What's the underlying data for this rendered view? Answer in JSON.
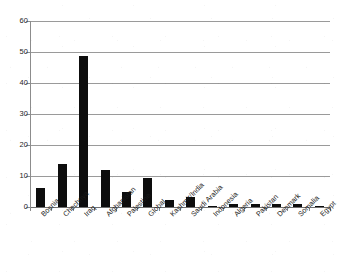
{
  "chart_data": {
    "type": "bar",
    "title": "",
    "subtitle": "",
    "xlabel": "",
    "ylabel": "",
    "ylim": [
      0,
      60
    ],
    "ytick_labels": [
      "0",
      "10",
      "20",
      "30",
      "40",
      "50",
      "60"
    ],
    "ytick_values": [
      0,
      10,
      20,
      30,
      40,
      50,
      60
    ],
    "grid": true,
    "legend": false,
    "legend_position": "none",
    "bar_color": "#0d0d0d",
    "gridline_color": "#9a9a9a",
    "background_color": "#ffffff",
    "xtick_label_rotation": -45,
    "categories": [
      "Bosnia",
      "Chechnya",
      "Iraq",
      "Afghanistan",
      "Palestine",
      "Global",
      "Kashmir/India",
      "Saudi Arabia",
      "Indonesia",
      "Algeria",
      "Pakistan",
      "Denmark",
      "Somalia",
      "Egypt"
    ],
    "values": [
      6.0,
      14.0,
      48.7,
      11.8,
      4.7,
      9.5,
      2.4,
      3.3,
      0.4,
      1.1,
      1.1,
      1.1,
      1.0,
      0.3
    ]
  }
}
